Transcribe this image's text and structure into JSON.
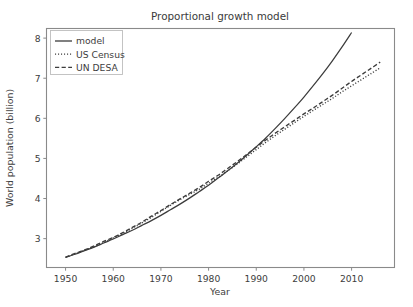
{
  "chart_data": {
    "type": "line",
    "title": "Proportional growth model",
    "xlabel": "Year",
    "ylabel": "World population (billion)",
    "xlim": [
      1946,
      2019
    ],
    "ylim": [
      2.28,
      8.24
    ],
    "xticks": [
      1950,
      1960,
      1970,
      1980,
      1990,
      2000,
      2010
    ],
    "xticklabels": [
      "1950",
      "1960",
      "1970",
      "1980",
      "1990",
      "2000",
      "2010"
    ],
    "yticks": [
      3,
      4,
      5,
      6,
      7,
      8
    ],
    "yticklabels": [
      "3",
      "4",
      "5",
      "6",
      "7",
      "8"
    ],
    "grid": false,
    "legend_position": "upper left",
    "line_color": "#3c3c3c",
    "x": [
      1950,
      1952,
      1954,
      1956,
      1958,
      1960,
      1962,
      1964,
      1966,
      1968,
      1970,
      1972,
      1974,
      1976,
      1978,
      1980,
      1982,
      1984,
      1986,
      1988,
      1990,
      1992,
      1994,
      1996,
      1998,
      2000,
      2002,
      2004,
      2006,
      2008,
      2010,
      2012,
      2014,
      2016
    ],
    "series": [
      {
        "name": "model",
        "style": "solid",
        "values": [
          2.53,
          2.61,
          2.7,
          2.79,
          2.89,
          2.99,
          3.1,
          3.21,
          3.33,
          3.45,
          3.58,
          3.72,
          3.86,
          4.01,
          4.17,
          4.33,
          4.51,
          4.69,
          4.88,
          5.08,
          5.29,
          5.51,
          5.75,
          6.0,
          6.26,
          6.53,
          6.82,
          7.12,
          7.44,
          7.78,
          8.14,
          8.51,
          8.91,
          9.33
        ]
      },
      {
        "name": "US Census",
        "style": "dotted",
        "values": [
          2.53,
          2.62,
          2.71,
          2.8,
          2.9,
          3.02,
          3.13,
          3.26,
          3.39,
          3.53,
          3.68,
          3.83,
          3.97,
          4.1,
          4.23,
          4.38,
          4.53,
          4.69,
          4.86,
          5.04,
          5.22,
          5.4,
          5.57,
          5.73,
          5.89,
          6.05,
          6.2,
          6.35,
          6.5,
          6.66,
          6.81,
          6.96,
          7.11,
          7.26
        ]
      },
      {
        "name": "UN DESA",
        "style": "dashed",
        "values": [
          2.54,
          2.63,
          2.72,
          2.82,
          2.93,
          3.03,
          3.15,
          3.28,
          3.41,
          3.56,
          3.7,
          3.85,
          3.99,
          4.13,
          4.27,
          4.43,
          4.58,
          4.75,
          4.92,
          5.1,
          5.28,
          5.46,
          5.63,
          5.79,
          5.95,
          6.11,
          6.26,
          6.42,
          6.58,
          6.75,
          6.92,
          7.08,
          7.24,
          7.4
        ]
      }
    ],
    "annotations": [],
    "note": "model curve tracks the census/DESA estimates through ~2003 then rises above them, reaching about 8.0 billion at the right edge while the two data series reach about 7.3 billion"
  },
  "legend": {
    "entries": [
      {
        "label": "model",
        "style": "solid"
      },
      {
        "label": "US Census",
        "style": "dotted"
      },
      {
        "label": "UN DESA",
        "style": "dashed"
      }
    ]
  }
}
